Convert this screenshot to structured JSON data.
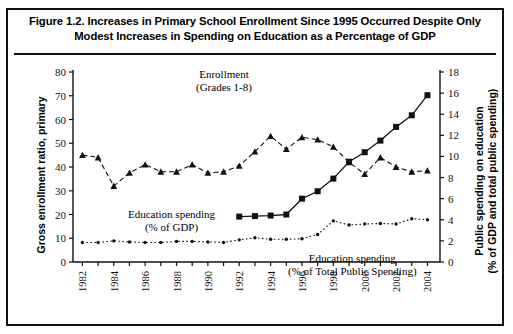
{
  "figure": {
    "title_line1": "Figure 1.2.  Increases in Primary School Enrollment Since 1995 Occurred Despite Only",
    "title_line2": "Modest Increases in Spending on Education as a Percentage of GDP"
  },
  "labels": {
    "left_axis": "Gross enrollment ratio, primary",
    "right_axis_line1": "Public spending on education",
    "right_axis_line2": "(% of GDP and total  public spending)",
    "anno_enrollment_line1": "Enrollment",
    "anno_enrollment_line2": "(Grades 1-8)",
    "anno_gdp_line1": "Education spending",
    "anno_gdp_line2": "(% of GDP)",
    "anno_total_line1": "Education spending",
    "anno_total_line2": "(% of Total  Public Spending)"
  },
  "colors": {
    "ink": "#111111",
    "background": "#ffffff"
  },
  "chart_data": {
    "type": "line",
    "title": "Figure 1.2.  Increases in Primary School Enrollment Since 1995 Occurred Despite Only Modest Increases in Spending on Education as a Percentage of GDP",
    "xlabel": "",
    "ylabel": "Gross enrollment ratio, primary",
    "y2label": "Public spending on education (% of GDP and total  public spending)",
    "x": [
      1982,
      1983,
      1984,
      1985,
      1986,
      1987,
      1988,
      1989,
      1990,
      1991,
      1992,
      1993,
      1994,
      1995,
      1996,
      1997,
      1998,
      1999,
      2000,
      2001,
      2002,
      2003,
      2004
    ],
    "xticklabels": [
      "1982",
      "1984",
      "1986",
      "1988",
      "1990",
      "1992",
      "1994",
      "1996",
      "1998",
      "2000",
      "2002",
      "2004"
    ],
    "xlim": [
      1981.4,
      2004.8
    ],
    "ylim": [
      0,
      80
    ],
    "yticks": [
      0,
      10,
      20,
      30,
      40,
      50,
      60,
      70,
      80
    ],
    "y2lim": [
      0,
      18
    ],
    "y2ticks": [
      0,
      2,
      4,
      6,
      8,
      10,
      12,
      14,
      16,
      18
    ],
    "grid": false,
    "legend": "annotations",
    "series": [
      {
        "name": "Enrollment (Grades 1-8)",
        "axis": "left",
        "marker": "triangle",
        "linestyle": "dashed",
        "x": [
          1982,
          1983,
          1984,
          1985,
          1986,
          1987,
          1988,
          1989,
          1990,
          1991,
          1992,
          1993,
          1994,
          1995,
          1996,
          1997,
          1998,
          1999,
          2000,
          2001,
          2002,
          2003,
          2004
        ],
        "values": [
          45.0,
          44.0,
          32.0,
          37.5,
          41.0,
          38.0,
          38.0,
          41.0,
          37.5,
          38.0,
          40.5,
          46.5,
          53.0,
          47.5,
          52.5,
          51.5,
          48.5,
          42.0,
          37.0,
          44.0,
          40.0,
          38.0,
          38.5
        ]
      },
      {
        "name": "Education spending (% of GDP)",
        "axis": "right",
        "marker": "dot",
        "linestyle": "dotted",
        "x": [
          1982,
          1983,
          1984,
          1985,
          1986,
          1987,
          1988,
          1989,
          1990,
          1991,
          1992,
          1993,
          1994,
          1995,
          1996,
          1997,
          1998,
          1999,
          2000,
          2001,
          2002,
          2003,
          2004
        ],
        "values": [
          1.85,
          1.85,
          2.0,
          1.9,
          1.85,
          1.85,
          1.95,
          1.95,
          1.9,
          1.85,
          2.1,
          2.3,
          2.15,
          2.15,
          2.2,
          2.6,
          3.9,
          3.5,
          3.6,
          3.65,
          3.6,
          4.1,
          4.0
        ]
      },
      {
        "name": "Education spending (% of Total  Public Spending)",
        "axis": "right",
        "marker": "square",
        "linestyle": "solid",
        "x": [
          1992,
          1993,
          1994,
          1995,
          1996,
          1997,
          1998,
          1999,
          2000,
          2001,
          2002,
          2003,
          2004
        ],
        "values": [
          4.3,
          4.35,
          4.4,
          4.5,
          6.0,
          6.7,
          7.9,
          9.5,
          10.4,
          11.5,
          12.8,
          13.9,
          14.9
        ]
      }
    ],
    "series_endpoint_note": {
      "total_public_last": 15.8,
      "total_public_last_year": 2004
    }
  }
}
